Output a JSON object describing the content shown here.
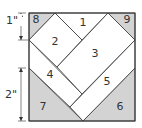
{
  "diagram": {
    "pieces": [
      {
        "id": "1",
        "label": "1",
        "fill": "#ffffff"
      },
      {
        "id": "2",
        "label": "2",
        "fill": "#ffffff"
      },
      {
        "id": "3",
        "label": "3",
        "fill": "#ffffff"
      },
      {
        "id": "4",
        "label": "4",
        "fill": "#ffffff"
      },
      {
        "id": "5",
        "label": "5",
        "fill": "#ffffff"
      },
      {
        "id": "6",
        "label": "6",
        "fill": "#d3d3d3"
      },
      {
        "id": "7",
        "label": "7",
        "fill": "#d3d3d3"
      },
      {
        "id": "8",
        "label": "8",
        "fill": "#d3d3d3"
      },
      {
        "id": "9",
        "label": "9",
        "fill": "#d3d3d3"
      }
    ],
    "dimensions": [
      {
        "label": "1\""
      },
      {
        "label": "2\""
      }
    ],
    "colors": {
      "background_piece": "#d3d3d3",
      "heart_piece": "#ffffff",
      "line": "#333333"
    }
  }
}
